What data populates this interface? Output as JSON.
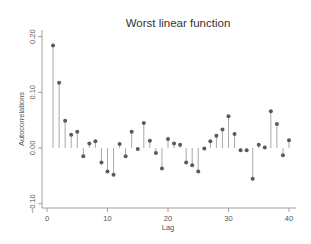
{
  "chart_data": {
    "type": "scatter",
    "subtype": "stem (autocorrelogram)",
    "title": "Worst linear function",
    "xlabel": "Lag",
    "ylabel": "Autocorrelations",
    "xlim": [
      0,
      40
    ],
    "ylim": [
      -0.1,
      0.2
    ],
    "xticks": [
      0,
      10,
      20,
      30,
      40
    ],
    "xtick_labels": [
      "0",
      "10",
      "20",
      "30",
      "40"
    ],
    "yticks": [
      -0.1,
      0.0,
      0.1,
      0.2
    ],
    "ytick_labels": [
      "-0.10",
      "0.00",
      "0.10",
      "0.20"
    ],
    "grid": false,
    "legend": null,
    "baseline": 0,
    "x": [
      1,
      2,
      3,
      4,
      5,
      6,
      7,
      8,
      9,
      10,
      11,
      12,
      13,
      14,
      15,
      16,
      17,
      18,
      19,
      20,
      21,
      22,
      23,
      24,
      25,
      26,
      27,
      28,
      29,
      30,
      31,
      32,
      33,
      34,
      35,
      36,
      37,
      38,
      39,
      40
    ],
    "values": [
      0.184,
      0.117,
      0.049,
      0.024,
      0.029,
      -0.015,
      0.008,
      0.012,
      -0.026,
      -0.042,
      -0.048,
      0.007,
      -0.015,
      0.029,
      -0.002,
      0.045,
      0.013,
      -0.009,
      -0.037,
      0.016,
      0.008,
      0.006,
      -0.026,
      -0.031,
      -0.042,
      -0.001,
      0.012,
      0.022,
      0.033,
      0.057,
      0.025,
      -0.004,
      -0.004,
      -0.055,
      0.006,
      0.001,
      0.066,
      0.043,
      -0.013,
      0.014
    ],
    "colors": {
      "marker": "#5a5a5a",
      "stem": "#a9a9a9",
      "axis": "#8a8a8a",
      "text": "#555555",
      "background": "#ffffff"
    }
  }
}
